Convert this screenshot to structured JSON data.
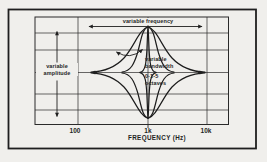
{
  "colors": {
    "background": "#f0efec",
    "ink": "#1f1f1f"
  },
  "figure": {
    "type": "parametric equaliser response diagram",
    "frequency_label": "variable frequency",
    "amplitude_label": "variable\namplitude",
    "bandwidth_label": "variable\nbandwidth",
    "octave_range_label": "0·1-5\n octaves",
    "curves": "boost and cut bell curves of wide, medium and narrow bandwidth, all centred on 1k",
    "x_axis": {
      "title": "FREQUENCY (Hz)",
      "scale": "log",
      "ticks": [
        "100",
        "1k",
        "10k"
      ]
    }
  }
}
